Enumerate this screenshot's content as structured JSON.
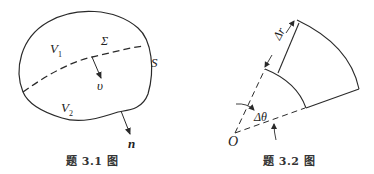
{
  "figures": [
    {
      "id": "fig-3-1",
      "caption": "题 3.1 图",
      "labels": {
        "region_upper": "V",
        "region_upper_sub": "1",
        "region_lower": "V",
        "region_lower_sub": "2",
        "interface": "Σ",
        "surface": "S",
        "velocity": "υ",
        "normal": "n"
      }
    },
    {
      "id": "fig-3-2",
      "caption": "题 3.2 图",
      "labels": {
        "radial_increment": "Δr",
        "angle_increment": "Δθ",
        "origin": "O"
      }
    }
  ],
  "colors": {
    "stroke": "#2a2a2a",
    "background": "#ffffff"
  }
}
